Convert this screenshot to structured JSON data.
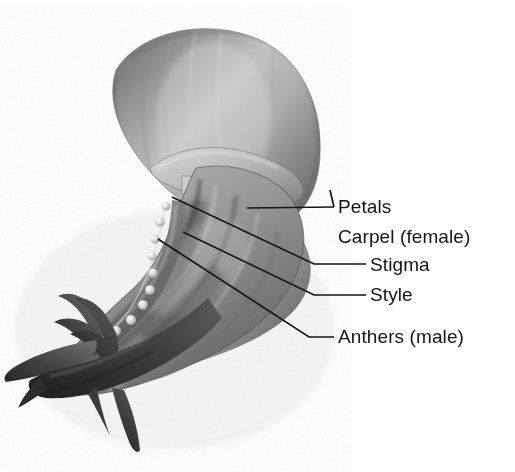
{
  "figure": {
    "style": "grayscale pencil illustration",
    "background_color": "#ffffff",
    "line_color": "#161616",
    "text_color": "#141414"
  },
  "labels": [
    {
      "id": "petals",
      "text": "Petals",
      "x": 338,
      "y": 213,
      "has_leader": true,
      "leader_type": "arrow-v"
    },
    {
      "id": "carpel",
      "text": "Carpel (female)",
      "x": 338,
      "y": 243,
      "has_leader": false,
      "leader_type": "none"
    },
    {
      "id": "stigma",
      "text": "Stigma",
      "x": 370,
      "y": 271,
      "has_leader": true,
      "leader_type": "elbow"
    },
    {
      "id": "style",
      "text": "Style",
      "x": 370,
      "y": 301,
      "has_leader": true,
      "leader_type": "elbow"
    },
    {
      "id": "anthers",
      "text": "Anthers (male)",
      "x": 338,
      "y": 343,
      "has_leader": true,
      "leader_type": "elbow"
    }
  ],
  "leaders": {
    "petals_upper": "M330,190 L334,207",
    "petals_lower": "M247,208 L334,207",
    "stigma": "M172,197 L314,264 L366,264",
    "style": "M183,232 L314,295 L366,295",
    "anthers": "M158,239 L309,337 L334,337"
  },
  "anthers_chain": {
    "count": 14,
    "color_light": "#e8e8e8",
    "color_mid": "#b9b9b9",
    "points": [
      [
        166,
        206
      ],
      [
        160,
        222
      ],
      [
        155,
        239
      ],
      [
        152,
        256
      ],
      [
        153,
        273
      ],
      [
        150,
        290
      ],
      [
        143,
        305
      ],
      [
        131,
        320
      ],
      [
        116,
        331
      ],
      [
        99,
        341
      ],
      [
        84,
        350
      ],
      [
        70,
        358
      ],
      [
        57,
        365
      ],
      [
        44,
        371
      ]
    ]
  },
  "palette": {
    "petal_light": "#d5d5d5",
    "petal_mid": "#a8a8a8",
    "petal_dark": "#6e6e6e",
    "sepal_dark": "#4a4a4a",
    "sepal_darkest": "#2e2e2e",
    "shadow": "#555555"
  }
}
